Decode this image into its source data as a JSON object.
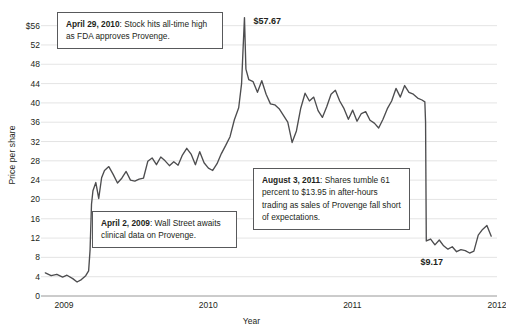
{
  "chart_data": {
    "type": "line",
    "title": "",
    "xlabel": "Year",
    "ylabel": "Price per share",
    "ylim": [
      0,
      58
    ],
    "xlim": [
      2008.92,
      2012.08
    ],
    "grid": true,
    "legend": "none",
    "yticks": [
      "$56",
      "52",
      "48",
      "44",
      "40",
      "36",
      "32",
      "28",
      "24",
      "20",
      "16",
      "12",
      "8",
      "4",
      "0"
    ],
    "ytick_values": [
      56,
      52,
      48,
      44,
      40,
      36,
      32,
      28,
      24,
      20,
      16,
      12,
      8,
      4,
      0
    ],
    "xticks": [
      "2009",
      "2010",
      "2011",
      "2012"
    ],
    "xtick_values": [
      2009,
      2010,
      2011,
      2012
    ],
    "series_name": "Dendreon share price",
    "line_color": "#4d4d4f",
    "x": [
      2008.95,
      2008.99,
      2009.03,
      2009.07,
      2009.1,
      2009.14,
      2009.17,
      2009.2,
      2009.23,
      2009.25,
      2009.26,
      2009.27,
      2009.28,
      2009.3,
      2009.32,
      2009.34,
      2009.36,
      2009.39,
      2009.42,
      2009.45,
      2009.48,
      2009.51,
      2009.54,
      2009.57,
      2009.6,
      2009.63,
      2009.66,
      2009.69,
      2009.72,
      2009.75,
      2009.78,
      2009.81,
      2009.84,
      2009.87,
      2009.9,
      2009.93,
      2009.96,
      2009.99,
      2010.02,
      2010.05,
      2010.08,
      2010.11,
      2010.14,
      2010.17,
      2010.2,
      2010.23,
      2010.26,
      2010.29,
      2010.31,
      2010.32,
      2010.33,
      2010.34,
      2010.36,
      2010.39,
      2010.42,
      2010.45,
      2010.48,
      2010.51,
      2010.54,
      2010.57,
      2010.6,
      2010.63,
      2010.66,
      2010.69,
      2010.72,
      2010.75,
      2010.78,
      2010.81,
      2010.84,
      2010.87,
      2010.9,
      2010.93,
      2010.96,
      2010.99,
      2011.02,
      2011.05,
      2011.08,
      2011.11,
      2011.14,
      2011.17,
      2011.2,
      2011.23,
      2011.26,
      2011.29,
      2011.32,
      2011.35,
      2011.38,
      2011.41,
      2011.44,
      2011.47,
      2011.5,
      2011.53,
      2011.56,
      2011.58,
      2011.585,
      2011.59,
      2011.62,
      2011.65,
      2011.68,
      2011.71,
      2011.74,
      2011.77,
      2011.8,
      2011.83,
      2011.86,
      2011.89,
      2011.92,
      2011.95,
      2011.98,
      2012.01,
      2012.04
    ],
    "y": [
      4.8,
      4.2,
      4.5,
      3.9,
      4.3,
      3.6,
      2.9,
      3.4,
      4.2,
      5.2,
      9.5,
      19.0,
      21.8,
      23.5,
      20.2,
      24.5,
      26.0,
      26.8,
      25.2,
      23.4,
      24.4,
      25.8,
      24.0,
      23.8,
      24.2,
      24.4,
      27.9,
      28.6,
      27.2,
      28.8,
      28.0,
      27.0,
      27.8,
      27.1,
      29.2,
      30.6,
      29.4,
      27.2,
      29.9,
      27.6,
      26.5,
      26.0,
      27.4,
      29.5,
      31.2,
      33.0,
      36.5,
      39.0,
      44.0,
      51.0,
      57.67,
      47.0,
      44.8,
      44.4,
      42.2,
      44.6,
      41.8,
      39.8,
      39.6,
      38.8,
      37.4,
      36.0,
      31.8,
      34.2,
      38.9,
      42.0,
      40.4,
      41.2,
      38.4,
      37.0,
      39.2,
      41.8,
      42.6,
      40.4,
      38.8,
      36.6,
      38.5,
      36.2,
      37.8,
      38.2,
      36.4,
      35.8,
      34.8,
      36.6,
      38.8,
      40.4,
      43.0,
      41.2,
      43.6,
      42.2,
      41.8,
      41.0,
      40.6,
      40.2,
      36.0,
      11.4,
      11.8,
      10.6,
      11.6,
      10.4,
      9.7,
      10.2,
      9.17,
      9.6,
      9.4,
      8.9,
      9.3,
      12.6,
      13.8,
      14.6,
      12.4
    ],
    "annotations": [
      {
        "id": "note-2010",
        "bold": "April 29, 2010",
        "text": ": Stock hits all-time high as FDA approves Provenge."
      },
      {
        "id": "note-2009",
        "bold": "April 2, 2009",
        "text": ": Wall Street awaits clinical data on Provenge."
      },
      {
        "id": "note-2011",
        "bold": "August 3, 2011",
        "text": ": Shares tumble 61 percent to $13.95 in after-hours trading as sales of Provenge fall short of expectations."
      }
    ],
    "point_labels": [
      {
        "id": "peak-label",
        "text": "$57.67",
        "value": 57.67
      },
      {
        "id": "low-label",
        "text": "$9.17",
        "value": 9.17
      }
    ]
  }
}
